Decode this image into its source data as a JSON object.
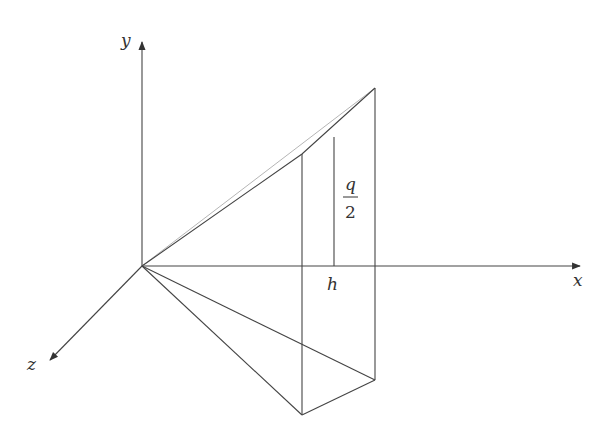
{
  "diagram": {
    "type": "3d-geometry-figure",
    "colors": {
      "line": "#444444",
      "faint_line": "#b5b5b5",
      "text": "#333333",
      "background": "#ffffff"
    },
    "origin": [
      142,
      266
    ],
    "axes": {
      "x": {
        "label": "x",
        "end": [
          582,
          266
        ]
      },
      "y": {
        "label": "y",
        "end": [
          142,
          40
        ]
      },
      "z": {
        "label": "z",
        "end": [
          48,
          362
        ]
      }
    },
    "labels": {
      "h": "h",
      "q_numerator": "q",
      "q_denominator": "2"
    },
    "points": {
      "top_near": [
        302,
        154
      ],
      "top_far": [
        375,
        88
      ],
      "mid_top": [
        334,
        137
      ],
      "bottom_near": [
        302,
        415
      ],
      "bottom_far": [
        375,
        380
      ],
      "x_near": [
        302,
        266
      ],
      "h_point": [
        334,
        266
      ],
      "x_far": [
        375,
        266
      ]
    }
  }
}
